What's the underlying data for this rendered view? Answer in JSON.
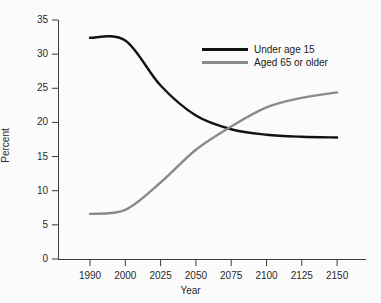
{
  "chart_data": {
    "type": "line",
    "title": "",
    "xlabel": "Year",
    "ylabel": "Percent",
    "grid": false,
    "legend_position": "top-right",
    "x_axis_scale": "categorical-even-spacing",
    "xticks": [
      "1990",
      "2000",
      "2025",
      "2050",
      "2075",
      "2100",
      "2125",
      "2150"
    ],
    "yticks": [
      "0",
      "5",
      "10",
      "15",
      "20",
      "25",
      "30",
      "35"
    ],
    "ylim": [
      0,
      35
    ],
    "x": [
      1990,
      2000,
      2025,
      2050,
      2075,
      2100,
      2125,
      2150
    ],
    "series": [
      {
        "name": "Under age 15",
        "color": "#121212",
        "values": [
          32.4,
          32.0,
          25.4,
          21.0,
          19.0,
          18.2,
          17.9,
          17.8
        ]
      },
      {
        "name": "Aged 65 or older",
        "color": "#8a8a8a",
        "values": [
          6.6,
          7.2,
          11.2,
          16.0,
          19.4,
          22.2,
          23.6,
          24.4
        ]
      }
    ],
    "annotations": {
      "crossover_year": "2073",
      "crossover_percent": "19.1"
    }
  },
  "legend": {
    "items": [
      {
        "label": "Under age 15",
        "color": "#121212"
      },
      {
        "label": "Aged 65 or older",
        "color": "#8a8a8a"
      }
    ]
  }
}
